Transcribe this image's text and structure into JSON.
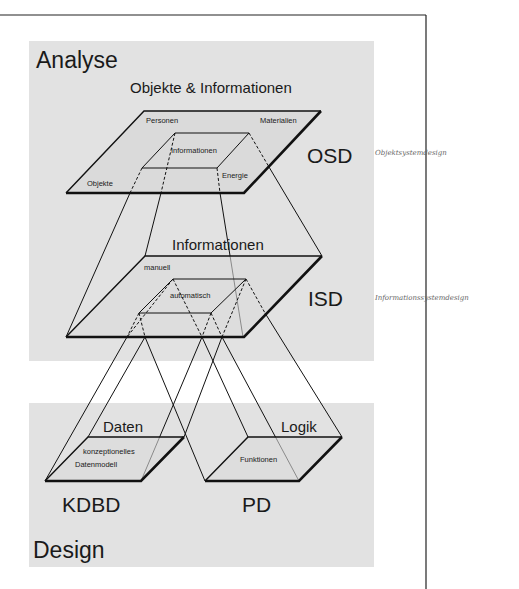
{
  "colors": {
    "background": "#ffffff",
    "band": "#e2e2e2",
    "plane": "#dadada",
    "line": "#111111",
    "handwriting": "#6a6a6a"
  },
  "sections": {
    "top_label": "Analyse",
    "bottom_label": "Design"
  },
  "layers": {
    "osd": {
      "heading": "Objekte & Informationen",
      "abbrev": "OSD",
      "corner_labels": [
        "Personen",
        "Materialien",
        "Objekte",
        "Energie"
      ],
      "inner_label": "Informationen",
      "annotation": "Objektsystemdesign"
    },
    "isd": {
      "heading": "Informationen",
      "abbrev": "ISD",
      "corner_label": "manuell",
      "inner_label": "automatisch",
      "annotation": "Informationssystemdesign"
    },
    "kdbd": {
      "heading": "Daten",
      "abbrev": "KDBD",
      "inner_label_line1": "konzeptionelles",
      "inner_label_line2": "Datenmodell"
    },
    "pd": {
      "heading": "Logik",
      "abbrev": "PD",
      "inner_label": "Funktionen"
    }
  }
}
